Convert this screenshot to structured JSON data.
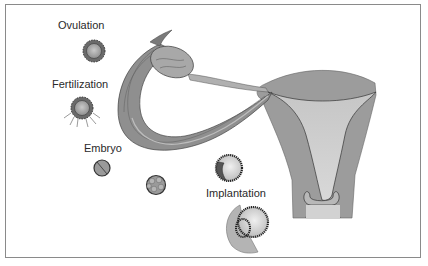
{
  "diagram": {
    "type": "biological-illustration",
    "labels": {
      "ovulation": "Ovulation",
      "fertilization": "Fertilization",
      "embryo": "Embryo",
      "implantation": "Implantation"
    },
    "stages": [
      {
        "name": "Ovulation",
        "depiction": "oocyte with corona radiata"
      },
      {
        "name": "Fertilization",
        "depiction": "oocyte with sperm around it"
      },
      {
        "name": "Embryo",
        "depiction": "2-cell embryo"
      },
      {
        "name": "Embryo",
        "depiction": "morula (multi-cell)"
      },
      {
        "name": "Implantation",
        "depiction": "blastocyst"
      },
      {
        "name": "Implantation",
        "depiction": "blastocyst embedding into endometrium"
      }
    ],
    "structures": [
      "ovary",
      "fallopian tube",
      "fimbriae",
      "uterus",
      "cervix"
    ],
    "colors": {
      "border": "#8a8a8a",
      "tissue_dark": "#8c8c8c",
      "tissue_mid": "#a6a6a6",
      "tissue_light": "#c8c8c8",
      "outline": "#333333",
      "text": "#2a2a2a"
    }
  }
}
